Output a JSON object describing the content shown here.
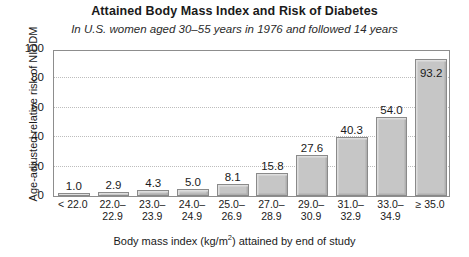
{
  "chart_data": {
    "type": "bar",
    "title": "Attained Body Mass Index and Risk of Diabetes",
    "subtitle": "In U.S. women aged 30–55 years in 1976 and followed 14 years",
    "xlabel_prefix": "Body mass index (kg/m",
    "xlabel_sup": "2",
    "xlabel_suffix": ") attained by end of study",
    "ylabel": "Age-adjusted relative risk of NIDDM",
    "categories": [
      "< 22.0",
      "22.0–22.9",
      "23.0–23.9",
      "24.0–24.9",
      "25.0–26.9",
      "27.0–28.9",
      "29.0–30.9",
      "31.0–32.9",
      "33.0–34.9",
      "≥ 35.0"
    ],
    "category_lines": [
      {
        "l1": "< 22.0",
        "l2": ""
      },
      {
        "l1": "22.0–",
        "l2": "22.9"
      },
      {
        "l1": "23.0–",
        "l2": "23.9"
      },
      {
        "l1": "24.0–",
        "l2": "24.9"
      },
      {
        "l1": "25.0–",
        "l2": "26.9"
      },
      {
        "l1": "27.0–",
        "l2": "28.9"
      },
      {
        "l1": "29.0–",
        "l2": "30.9"
      },
      {
        "l1": "31.0–",
        "l2": "32.9"
      },
      {
        "l1": "33.0–",
        "l2": "34.9"
      },
      {
        "l1": "≥ 35.0",
        "l2": ""
      }
    ],
    "values": [
      1.0,
      2.9,
      4.3,
      5.0,
      8.1,
      15.8,
      27.6,
      40.3,
      54.0,
      93.2
    ],
    "value_labels": [
      "1.0",
      "2.9",
      "4.3",
      "5.0",
      "8.1",
      "15.8",
      "27.6",
      "40.3",
      "54.0",
      "93.2"
    ],
    "yticks": [
      0,
      20,
      40,
      60,
      80,
      100
    ],
    "ytick_labels": [
      "0",
      "20",
      "40",
      "60",
      "80",
      "100"
    ],
    "ylim": [
      0,
      100
    ],
    "gridlines": [
      20,
      40,
      60,
      80
    ],
    "grid": true,
    "legend": "none",
    "bar_color": "#c6c6c6",
    "bar_edge_color": "#8a8a8a",
    "frame_color": "#8d8d8d",
    "grid_color": "#bdbdbd",
    "text_color": "#1a1a1a"
  }
}
